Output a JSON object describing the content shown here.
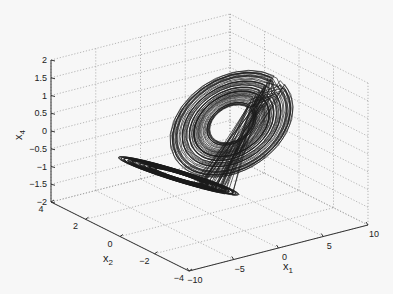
{
  "chart_data": {
    "type": "line",
    "subtype": "3d-trajectory",
    "title": "",
    "axes": {
      "x1": {
        "label": "x",
        "subscript": "1",
        "range": [
          -10,
          10
        ],
        "ticks": [
          "-10",
          "-5",
          "0",
          "5",
          "10"
        ]
      },
      "x2": {
        "label": "x",
        "subscript": "2",
        "range": [
          -4,
          4
        ],
        "ticks": [
          "4",
          "2",
          "0",
          "-2",
          "-4"
        ]
      },
      "x4": {
        "label": "x",
        "subscript": "4",
        "range": [
          -2,
          2
        ],
        "ticks": [
          "2",
          "1.5",
          "1",
          "0.5",
          "0",
          "-0.5",
          "-1",
          "-1.5",
          "-2"
        ]
      }
    },
    "grid": true,
    "legend": null,
    "series": [
      {
        "name": "trajectory",
        "color": "#1a1a1a",
        "approx_extent": {
          "x1": [
            -8,
            8
          ],
          "x2": [
            -3,
            3
          ],
          "x4": [
            -1.8,
            1.5
          ]
        }
      }
    ]
  }
}
